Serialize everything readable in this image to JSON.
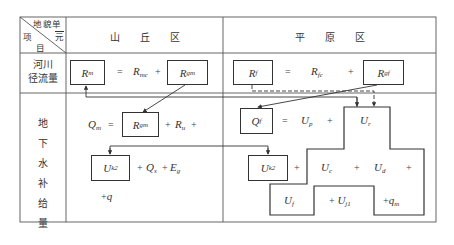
{
  "header": {
    "corner": {
      "top_right": [
        "地",
        "貌",
        "单",
        "元"
      ],
      "bottom_left": [
        "项",
        "目"
      ]
    },
    "col_mountain": "山　　丘　　区",
    "col_plain": "平　　原　　区"
  },
  "rows": {
    "river_runoff": {
      "label_line1": "河川",
      "label_line2": "径流量"
    },
    "groundwater_recharge": {
      "label_chars": [
        "地",
        "下",
        "水",
        "补",
        "给",
        "量"
      ]
    }
  },
  "mountain": {
    "runoff": {
      "Rm": {
        "base": "R",
        "sub": "m"
      },
      "eq": "=",
      "Rmc": {
        "base": "R",
        "sub": "mc"
      },
      "plus": "+",
      "Rgm": {
        "base": "R",
        "sub": "gm"
      }
    },
    "recharge": {
      "Qm": {
        "base": "Q",
        "sub": "m"
      },
      "eq": "=",
      "Rgm": {
        "base": "R",
        "sub": "gm"
      },
      "plus1": "+",
      "Ru": {
        "base": "R",
        "sub": "u"
      },
      "plus2": "+",
      "Uk2": {
        "base": "U",
        "sub": "k2"
      },
      "plus3": "+",
      "Qs": {
        "base": "Q",
        "sub": "s"
      },
      "plus4": "+",
      "Eg": {
        "base": "E",
        "sub": "g"
      },
      "plus_q": "+",
      "q": "q"
    }
  },
  "plain": {
    "runoff": {
      "Rf": {
        "base": "R",
        "sub": "f"
      },
      "eq": "=",
      "Rfc": {
        "base": "R",
        "sub": "fc"
      },
      "plus": "+",
      "Rgf": {
        "base": "R",
        "sub": "gf"
      }
    },
    "recharge": {
      "Qf": {
        "base": "Q",
        "sub": "f"
      },
      "eq": "=",
      "Up": {
        "base": "U",
        "sub": "p"
      },
      "plus1": "+",
      "Ur": {
        "base": "U",
        "sub": "r"
      },
      "Uk2": {
        "base": "U",
        "sub": "k2"
      },
      "plus2": "+",
      "Uc": {
        "base": "U",
        "sub": "c"
      },
      "plus3": "+",
      "Ud": {
        "base": "U",
        "sub": "d"
      },
      "plus4": "+",
      "Uf": {
        "base": "U",
        "sub": "f"
      },
      "plus5": "+",
      "Uj1": {
        "base": "U",
        "sub": "j1"
      },
      "plus6": "+",
      "qm": {
        "base": "q",
        "sub": "m"
      }
    }
  }
}
